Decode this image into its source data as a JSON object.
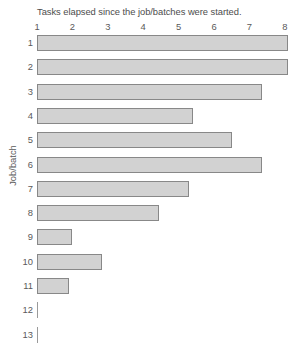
{
  "chart_data": {
    "type": "bar",
    "orientation": "horizontal",
    "title": "Tasks elapsed since the job/batches were started.",
    "xlabel": "",
    "ylabel": "Job/batch",
    "categories": [
      "1",
      "2",
      "3",
      "4",
      "5",
      "6",
      "7",
      "8",
      "9",
      "10",
      "11",
      "12",
      "13"
    ],
    "values": [
      8.1,
      8.1,
      7.35,
      5.4,
      6.5,
      7.35,
      5.3,
      4.45,
      2.0,
      2.85,
      1.9,
      1.0,
      1.0
    ],
    "xticks": [
      "1",
      "2",
      "3",
      "4",
      "5",
      "6",
      "7",
      "8"
    ],
    "xtick_values": [
      1,
      2,
      3,
      4,
      5,
      6,
      7,
      8
    ],
    "xlim": [
      1,
      8.1
    ],
    "grid": false,
    "legend": false,
    "bar_fill": "#d2d2d2",
    "bar_border": "#888888",
    "background": "#ffffff"
  }
}
